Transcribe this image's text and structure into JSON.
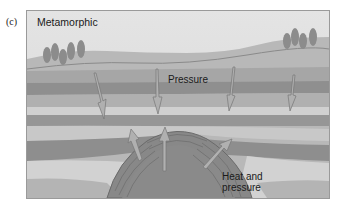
{
  "figure": {
    "panel_label": "(c)",
    "title": "Metamorphic",
    "labels": {
      "pressure": "Pressure",
      "heat_line1": "Heat and",
      "heat_line2": "pressure"
    }
  },
  "colors": {
    "sky": "#dcdcdc",
    "hill": "#b4b4b4",
    "layer_dark": "#8e8e8e",
    "layer_mid": "#a8a8a8",
    "layer_light": "#cfcfcf",
    "intrusion": "#7e7e7e",
    "trees": "#8a8a8a"
  }
}
